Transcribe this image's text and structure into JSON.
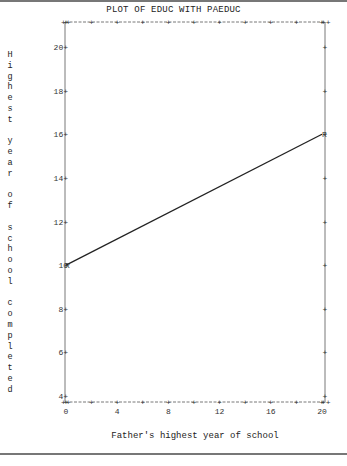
{
  "chart_data": {
    "type": "line",
    "title": "PLOT OF EDUC WITH PAEDUC",
    "xlabel": "Father's highest year of school",
    "ylabel": "Highest year of school completed",
    "x_ticks": [
      0,
      4,
      8,
      12,
      16,
      20
    ],
    "y_ticks": [
      4,
      6,
      8,
      10,
      12,
      14,
      16,
      18,
      20
    ],
    "xlim": [
      0,
      20
    ],
    "ylim": [
      4,
      21
    ],
    "grid": false,
    "series": [
      {
        "name": "Regression line",
        "marker": "R",
        "x": [
          0,
          20
        ],
        "y": [
          10,
          16
        ]
      }
    ]
  }
}
